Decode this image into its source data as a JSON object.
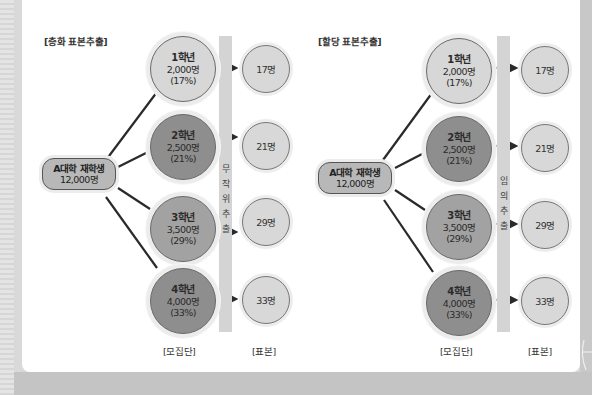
{
  "left_diagram": {
    "title": "[층화 표본추출]",
    "root": {
      "line1": "A대학 재학생",
      "line2": "12,000명"
    },
    "bar_label": [
      "무",
      "작",
      "위",
      "추",
      "출"
    ],
    "strata": [
      {
        "grade": "1학년",
        "count": "2,000명",
        "pct": "(17%)",
        "sample": "17명"
      },
      {
        "grade": "2학년",
        "count": "2,500명",
        "pct": "(21%)",
        "sample": "21명"
      },
      {
        "grade": "3학년",
        "count": "3,500명",
        "pct": "(29%)",
        "sample": "29명"
      },
      {
        "grade": "4학년",
        "count": "4,000명",
        "pct": "(33%)",
        "sample": "33명"
      }
    ],
    "population_label": "[모집단]",
    "sample_label": "[표본]"
  },
  "right_diagram": {
    "title": "[할당 표본추출]",
    "root": {
      "line1": "A대학 재학생",
      "line2": "12,000명"
    },
    "bar_label": [
      "임",
      "의",
      "추",
      "출"
    ],
    "strata": [
      {
        "grade": "1학년",
        "count": "2,000명",
        "pct": "(17%)",
        "sample": "17명"
      },
      {
        "grade": "2학년",
        "count": "2,500명",
        "pct": "(21%)",
        "sample": "21명"
      },
      {
        "grade": "3학년",
        "count": "3,500명",
        "pct": "(29%)",
        "sample": "29명"
      },
      {
        "grade": "4학년",
        "count": "4,000명",
        "pct": "(33%)",
        "sample": "33명"
      }
    ],
    "population_label": "[모집단]",
    "sample_label": "[표본]"
  },
  "colors": {
    "grade1_fill": "#d7d7d7",
    "grade2_fill": "#8e8e8e",
    "grade3_fill": "#a2a2a2",
    "grade4_fill": "#8e8e8e",
    "sample_fill": "#d8d8d8",
    "root_fill": "#b8b8b8",
    "bar_fill": "#d4d4d4",
    "line": "#2a2a2a"
  }
}
